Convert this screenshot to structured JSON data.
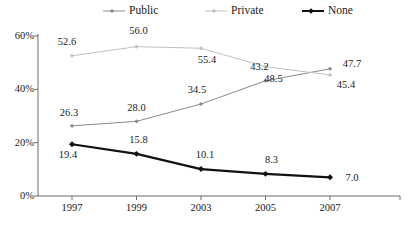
{
  "legend": {
    "items": [
      {
        "label": "Public",
        "color": "#8a8a8a",
        "icon": "line-marker-icon"
      },
      {
        "label": "Private",
        "color": "#c0c0c0",
        "icon": "line-marker-icon"
      },
      {
        "label": "None",
        "color": "#111111",
        "icon": "line-marker-icon"
      }
    ]
  },
  "chart_data": {
    "type": "line",
    "title": "",
    "xlabel": "",
    "ylabel": "",
    "categories": [
      "1997",
      "1999",
      "2003",
      "2005",
      "2007"
    ],
    "x": [
      1997,
      1999,
      2003,
      2005,
      2007
    ],
    "ylim": [
      0,
      60
    ],
    "yticks": [
      0,
      20,
      40,
      60
    ],
    "ytick_labels": [
      "0%",
      "20%",
      "40%",
      "60%"
    ],
    "grid": false,
    "legend_position": "top",
    "series": [
      {
        "name": "Public",
        "color": "#8a8a8a",
        "values": [
          26.3,
          28.0,
          34.5,
          43.2,
          47.7
        ],
        "labels": [
          "26.3",
          "28.0",
          "34.5",
          "43.2",
          "47.7"
        ]
      },
      {
        "name": "Private",
        "color": "#c0c0c0",
        "values": [
          52.6,
          56.0,
          55.4,
          48.5,
          45.4
        ],
        "labels": [
          "52.6",
          "56.0",
          "55.4",
          "48.5",
          "45.4"
        ]
      },
      {
        "name": "None",
        "color": "#111111",
        "values": [
          19.4,
          15.8,
          10.1,
          8.3,
          7.0
        ],
        "labels": [
          "19.4",
          "15.8",
          "10.1",
          "8.3",
          "7.0"
        ]
      }
    ]
  },
  "axes": {
    "y_labels": [
      "60%",
      "40%",
      "20%",
      "0%"
    ],
    "x_labels": [
      "1997",
      "1999",
      "2003",
      "2005",
      "2007"
    ]
  },
  "point_labels": {
    "public": [
      "26.3",
      "28.0",
      "34.5",
      "43.2",
      "47.7"
    ],
    "private": [
      "52.6",
      "56.0",
      "55.4",
      "48.5",
      "45.4"
    ],
    "none": [
      "19.4",
      "15.8",
      "10.1",
      "8.3",
      "7.0"
    ]
  }
}
